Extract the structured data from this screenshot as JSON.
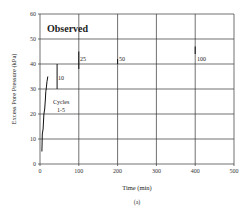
{
  "chart_data": {
    "type": "line",
    "title": "",
    "subtitle": "",
    "panel_label": "(a)",
    "annotation_title": "Observed",
    "xlabel": "Time (min)",
    "ylabel": "Excess Pore Pressure (kPa)",
    "xlim": [
      0,
      500
    ],
    "ylim": [
      0,
      60
    ],
    "xticks": [
      0,
      100,
      200,
      300,
      400,
      500
    ],
    "yticks": [
      0,
      10,
      20,
      30,
      40,
      50,
      60
    ],
    "grid": true,
    "legend": null,
    "series": [
      {
        "name": "Cycles 1-5",
        "x": [
          5,
          6,
          8,
          10,
          12,
          14,
          15,
          16,
          18,
          20
        ],
        "y": [
          5,
          12,
          14,
          20,
          22,
          26,
          29,
          30,
          33,
          35
        ]
      },
      {
        "name": "Cycle 10",
        "x": [
          44,
          44
        ],
        "y": [
          30,
          40
        ]
      },
      {
        "name": "Cycle 25",
        "x": [
          100,
          100
        ],
        "y": [
          38,
          45
        ]
      },
      {
        "name": "Cycle 50",
        "x": [
          200,
          200
        ],
        "y": [
          40,
          42
        ]
      },
      {
        "name": "Cycle 100",
        "x": [
          400,
          400
        ],
        "y": [
          44,
          47
        ]
      }
    ],
    "annotations": [
      {
        "text": "10",
        "x": 46,
        "y": 36
      },
      {
        "text": "25",
        "x": 102,
        "y": 41
      },
      {
        "text": "50",
        "x": 204,
        "y": 41
      },
      {
        "text": "100",
        "x": 404,
        "y": 41
      },
      {
        "text": "Cycles",
        "x": 55,
        "y": 27
      },
      {
        "text": "1-5",
        "x": 60,
        "y": 23
      }
    ]
  },
  "labels": {
    "observed": "Observed",
    "xlabel": "Time (min)",
    "ylabel": "Excess Pore Pressure (kPa)",
    "panel": "(a)",
    "cycles_line1": "Cycles",
    "cycles_line2": "1-5",
    "ann_10": "10",
    "ann_25": "25",
    "ann_50": "50",
    "ann_100": "100"
  }
}
